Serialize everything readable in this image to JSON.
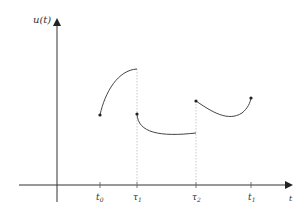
{
  "diagram": {
    "type": "piecewise-function-plot",
    "y_axis": {
      "label": "u(t)"
    },
    "x_axis": {
      "label": "t"
    },
    "ticks": [
      {
        "id": "t0",
        "base": "t",
        "sub": "0",
        "x": 100
      },
      {
        "id": "tau1",
        "base": "τ",
        "sub": "1",
        "x": 137
      },
      {
        "id": "tau2",
        "base": "τ",
        "sub": "2",
        "x": 196
      },
      {
        "id": "t1",
        "base": "t",
        "sub": "1",
        "x": 251
      }
    ],
    "segments": [
      {
        "id": "segment-1",
        "from_tick": "t0",
        "to_tick": "tau1",
        "shape": "concave-increasing",
        "start": [
          100,
          115
        ],
        "end": [
          137,
          69
        ],
        "start_dot": true,
        "end_dot": false
      },
      {
        "id": "segment-2",
        "from_tick": "tau1",
        "to_tick": "tau2",
        "shape": "decreasing-convex",
        "start": [
          137,
          114
        ],
        "end": [
          196,
          133
        ],
        "start_dot": true,
        "end_dot": false
      },
      {
        "id": "segment-3",
        "from_tick": "tau2",
        "to_tick": "t1",
        "shape": "u-shaped",
        "start": [
          196,
          101
        ],
        "end": [
          251,
          98
        ],
        "start_dot": true,
        "end_dot": true
      }
    ],
    "dashed_guides": [
      {
        "x": 137,
        "from_y": 69,
        "to_y": 185
      },
      {
        "x": 196,
        "from_y": 101,
        "to_y": 185
      }
    ],
    "colors": {
      "axis": "#333333",
      "curve": "#444444",
      "guide": "#bbbbbb"
    }
  }
}
